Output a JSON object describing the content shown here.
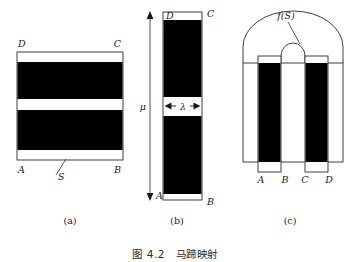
{
  "figure": {
    "caption": "图 4.2　马蹄映射",
    "panels": [
      {
        "id": "a",
        "caption": "(a)"
      },
      {
        "id": "b",
        "caption": "(b)"
      },
      {
        "id": "c",
        "caption": "(c)"
      }
    ]
  },
  "panel_a": {
    "caption": "(a)",
    "corner_labels": {
      "top_left": "D",
      "top_right": "C",
      "bottom_left": "A",
      "bottom_right": "B"
    },
    "region_label": "S",
    "bands": [
      {
        "name": "upper-black-band",
        "fill": "#000000"
      },
      {
        "name": "lower-black-band",
        "fill": "#000000"
      }
    ],
    "outline_color": "#000000",
    "background": "#ffffff"
  },
  "panel_b": {
    "caption": "(b)",
    "corner_labels": {
      "top_left": "D",
      "top_right": "C",
      "bottom_left": "A",
      "bottom_right": "B"
    },
    "height_label": "μ",
    "width_label": "λ",
    "bands": [
      {
        "name": "upper-black-band",
        "fill": "#000000"
      },
      {
        "name": "lower-black-band",
        "fill": "#000000"
      }
    ],
    "outline_color": "#000000"
  },
  "panel_c": {
    "caption": "(c)",
    "map_label": "f(S)",
    "foot_labels": [
      "A",
      "B",
      "C",
      "D"
    ],
    "bands": [
      {
        "name": "left-black-leg",
        "fill": "#000000"
      },
      {
        "name": "right-black-leg",
        "fill": "#000000"
      }
    ],
    "outline_color": "#000000"
  },
  "colors": {
    "ink": "#000000",
    "line": "#2a2a2a",
    "paper": "#ffffff"
  }
}
